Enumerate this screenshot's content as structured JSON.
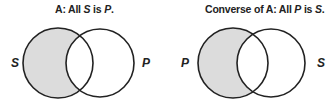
{
  "diagrams": [
    {
      "title_prefix": "A:  All ",
      "title_subject": "S",
      "title_mid": " is ",
      "title_predicate": "P",
      "title_suffix": ".",
      "left_label": "S",
      "right_label": "P",
      "shaded_region": "left-only"
    },
    {
      "title_prefix": "Converse of A:  All ",
      "title_subject": "P",
      "title_mid": " is ",
      "title_predicate": "S",
      "title_suffix": ".",
      "left_label": "P",
      "right_label": "S",
      "shaded_region": "left-only"
    }
  ],
  "colors": {
    "shade": "#dcdcdc",
    "stroke": "#222222"
  }
}
